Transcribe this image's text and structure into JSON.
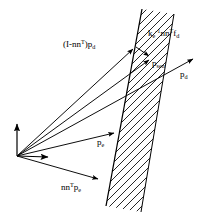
{
  "figure": {
    "type": "vector-diagram",
    "background_color": "#ffffff",
    "stroke_color": "#000000"
  },
  "labels": {
    "projected_desired": {
      "text": "(I-nn",
      "sup": "T",
      "tail": ")p",
      "sub": "d",
      "full": "(I-nn^T)p_d"
    },
    "force_term": {
      "base": "k",
      "base_sub": "e",
      "base_sup": "-1",
      "mid": "nn",
      "mid_sup": "T",
      "tail": "f",
      "tail_sub": "d",
      "full": "k_e^-1 nn^T f_d"
    },
    "sensed": {
      "base": "p",
      "sub": "sen",
      "full": "p_sen"
    },
    "desired": {
      "base": "p",
      "sub": "d",
      "full": "p_d"
    },
    "environment": {
      "base": "p",
      "sub": "e",
      "full": "p_e"
    },
    "normal_environment": {
      "base": "nn",
      "sup": "T",
      "tail": "p",
      "tail_sub": "e",
      "full": "nn^T p_e"
    }
  },
  "geometry": {
    "origin": {
      "x": 17,
      "y": 156
    },
    "frame_axes": [
      {
        "name": "vertical-axis",
        "x1": 17,
        "y1": 156,
        "x2": 17,
        "y2": 121
      },
      {
        "name": "horizontal-axis",
        "x1": 17,
        "y1": 156,
        "x2": 51,
        "y2": 157
      }
    ],
    "vectors": [
      {
        "name": "vector-projected-desired",
        "x1": 17,
        "y1": 156,
        "x2": 136,
        "y2": 47
      },
      {
        "name": "vector-sensed",
        "x1": 17,
        "y1": 156,
        "x2": 152,
        "y2": 58
      },
      {
        "name": "vector-desired",
        "x1": 17,
        "y1": 156,
        "x2": 196,
        "y2": 57
      },
      {
        "name": "vector-environment",
        "x1": 17,
        "y1": 156,
        "x2": 117,
        "y2": 133
      },
      {
        "name": "vector-normal-environment",
        "x1": 17,
        "y1": 156,
        "x2": 101,
        "y2": 180
      },
      {
        "name": "vector-force-term",
        "x1": 136,
        "y1": 47,
        "x2": 152,
        "y2": 58
      }
    ],
    "wall": {
      "name": "contact-surface",
      "left_edge": [
        {
          "x": 142,
          "y": 9
        },
        {
          "x": 106,
          "y": 206
        }
      ],
      "right_edge": [
        {
          "x": 174,
          "y": 14
        },
        {
          "x": 141,
          "y": 212
        }
      ],
      "hatch_angle_deg": 55,
      "hatch_spacing_px": 6
    }
  }
}
